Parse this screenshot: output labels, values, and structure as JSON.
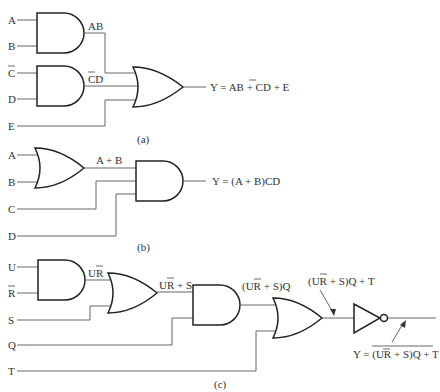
{
  "diagram_a": {
    "caption": "(a)",
    "inputs": [
      "A",
      "B",
      "C",
      "D",
      "E"
    ],
    "input_c_negated": true,
    "wire_labels": {
      "and1": "AB",
      "and2": "CD"
    },
    "output": "Y = AB + CD + E",
    "output_parts": {
      "prefix": "Y = AB + ",
      "negated": "C",
      "suffix": "D + E"
    }
  },
  "diagram_b": {
    "caption": "(b)",
    "inputs": [
      "A",
      "B",
      "C",
      "D"
    ],
    "wire_labels": {
      "or1": "A + B"
    },
    "output": "Y = (A + B)CD"
  },
  "diagram_c": {
    "caption": "(c)",
    "inputs": [
      "U",
      "R",
      "S",
      "Q",
      "T"
    ],
    "input_r_negated": true,
    "wire_labels": {
      "and1": "UR",
      "or2": "UR + S",
      "and3": "(UR + S)Q",
      "or4": "(UR + S)Q + T"
    },
    "output": "Y = NOT((UR + S)Q + T)",
    "output_parts": {
      "prefix": "Y = ",
      "body": "(UR + S)Q + T"
    }
  }
}
